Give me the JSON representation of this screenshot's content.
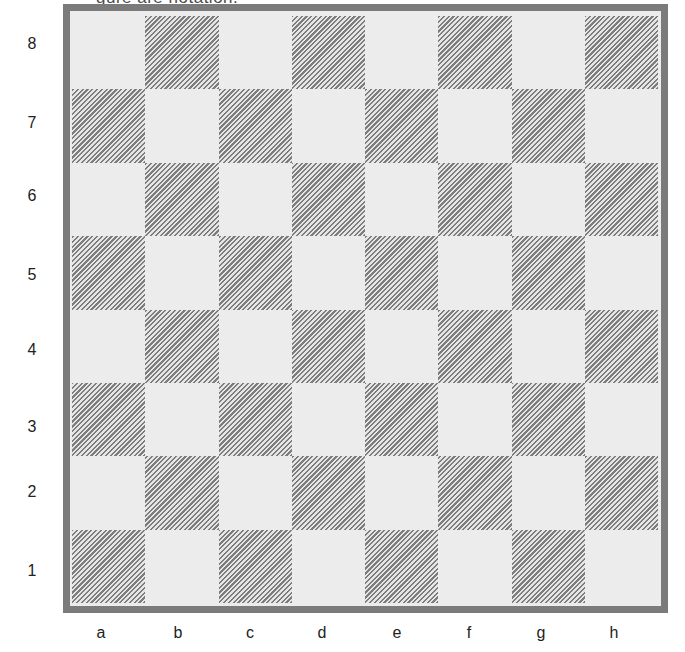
{
  "caption_fragment": "gure are notation.",
  "board": {
    "files": [
      "a",
      "b",
      "c",
      "d",
      "e",
      "f",
      "g",
      "h"
    ],
    "ranks": [
      "8",
      "7",
      "6",
      "5",
      "4",
      "3",
      "2",
      "1"
    ],
    "light_color": "#ececec",
    "dark_hatch_color": "#7d7d7d",
    "border_color": "#7b7b7b",
    "pieces": []
  }
}
